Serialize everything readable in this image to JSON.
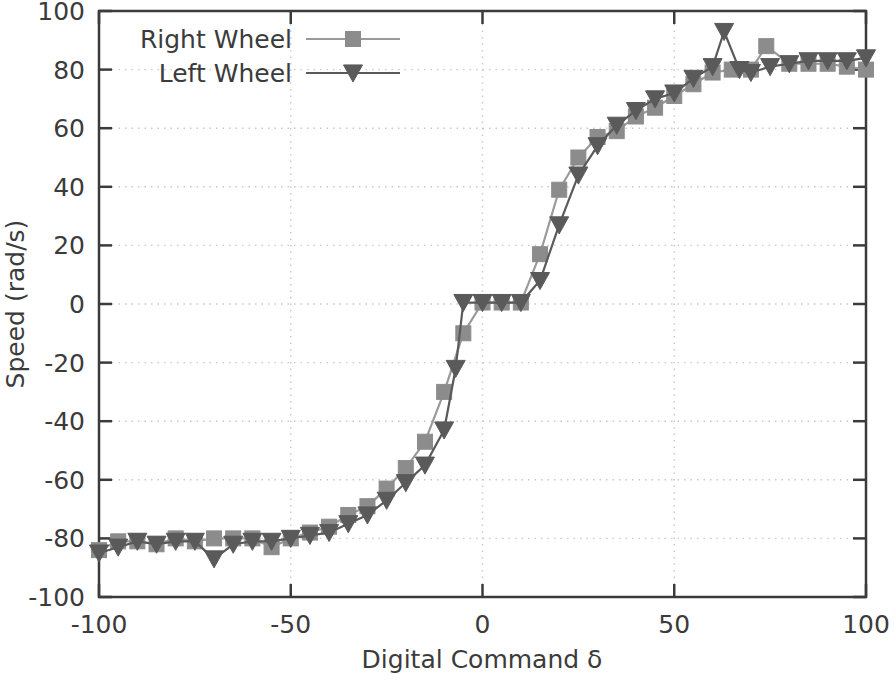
{
  "chart_data": {
    "type": "line",
    "title": "",
    "xlabel": "Digital Command δ",
    "ylabel": "Speed (rad/s)",
    "xlim": [
      -100,
      100
    ],
    "ylim": [
      -100,
      100
    ],
    "xticks": [
      -100,
      -50,
      0,
      50,
      100
    ],
    "yticks": [
      -100,
      -80,
      -60,
      -40,
      -20,
      0,
      20,
      40,
      60,
      80,
      100
    ],
    "xtick_labels": [
      "-100",
      "-50",
      "0",
      "50",
      "100"
    ],
    "ytick_labels": [
      "-100",
      "-80",
      "-60",
      "-40",
      "-20",
      "0",
      "20",
      "40",
      "60",
      "80",
      "100"
    ],
    "grid": true,
    "grid_style": "dotted",
    "legend_position": "top-left-inside",
    "series": [
      {
        "name": "Right Wheel",
        "marker": "square",
        "color": "#8c8c8c",
        "line_color": "#9a9a9a",
        "x": [
          -100,
          -95,
          -90,
          -85,
          -80,
          -75,
          -70,
          -65,
          -60,
          -55,
          -50,
          -45,
          -40,
          -35,
          -30,
          -25,
          -20,
          -15,
          -10,
          -5,
          0,
          5,
          10,
          15,
          20,
          25,
          30,
          35,
          40,
          45,
          50,
          55,
          60,
          65,
          70,
          74,
          80,
          85,
          90,
          95,
          100
        ],
        "y": [
          -84,
          -81,
          -81,
          -82,
          -80,
          -81,
          -80,
          -80,
          -80,
          -83,
          -80,
          -78,
          -76,
          -72,
          -69,
          -63,
          -56,
          -47,
          -30,
          -10,
          0.5,
          0.5,
          0.5,
          17,
          39,
          50,
          57,
          59,
          64,
          67,
          71,
          75,
          79,
          80,
          80,
          88,
          82,
          82,
          82,
          81,
          80
        ]
      },
      {
        "name": "Left Wheel",
        "marker": "triangle-down",
        "color": "#5a5a5a",
        "line_color": "#5a5a5a",
        "x": [
          -100,
          -95,
          -90,
          -85,
          -80,
          -75,
          -70,
          -65,
          -60,
          -55,
          -50,
          -45,
          -40,
          -35,
          -30,
          -25,
          -20,
          -15,
          -10,
          -7,
          -5,
          0,
          5,
          10,
          15,
          20,
          25,
          30,
          35,
          40,
          45,
          50,
          55,
          60,
          63,
          67,
          70,
          75,
          80,
          85,
          90,
          95,
          100
        ],
        "y": [
          -85,
          -83,
          -81,
          -82,
          -81,
          -81,
          -87,
          -82,
          -81,
          -81,
          -80,
          -79,
          -78,
          -75,
          -72,
          -67,
          -61,
          -55,
          -43,
          -22,
          0.5,
          0.5,
          0.5,
          0.5,
          8,
          27,
          44,
          54,
          61,
          66,
          70,
          72,
          77,
          81,
          93,
          80,
          79,
          81,
          82,
          83,
          83,
          83,
          84
        ]
      }
    ]
  },
  "legend": {
    "entries": [
      {
        "label": "Right Wheel",
        "marker": "square-marker",
        "color": "#8c8c8c"
      },
      {
        "label": "Left Wheel",
        "marker": "triangle-down-marker",
        "color": "#5a5a5a"
      }
    ]
  },
  "colors": {
    "right_wheel": "#8c8c8c",
    "left_wheel": "#5a5a5a",
    "axis": "#3b3b3b",
    "grid": "#c8c8c8",
    "background": "#ffffff"
  }
}
